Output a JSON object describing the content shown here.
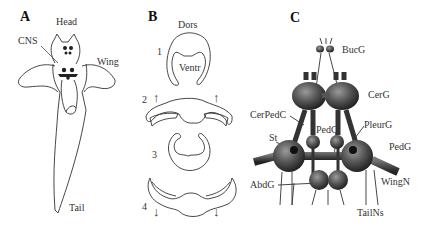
{
  "panels": {
    "a": {
      "letter": "A",
      "labels": {
        "head": "Head",
        "cns": "CNS",
        "wing": "Wing",
        "tail": "Tail"
      }
    },
    "b": {
      "letter": "B",
      "labels": {
        "dors": "Dors",
        "ventr": "Ventr",
        "step1": "1",
        "step2": "2",
        "step3": "3",
        "step4": "4"
      },
      "arrows": {
        "up": "↑",
        "down": "↓"
      }
    },
    "c": {
      "letter": "C",
      "labels": {
        "bucg": "BucG",
        "cerg": "CerG",
        "cerpedc": "CerPedC",
        "pleurg": "PleurG",
        "pedc": "PedC",
        "st": "St",
        "pedg": "PedG",
        "abdg": "AbdG",
        "wingn": "WingN",
        "tailns": "TailNs"
      }
    }
  }
}
